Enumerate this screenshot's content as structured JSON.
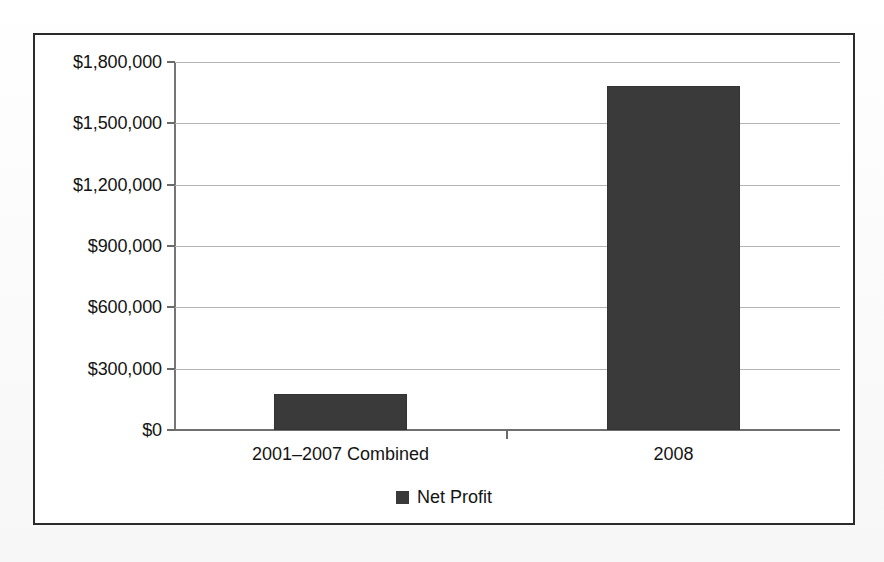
{
  "chart_data": {
    "type": "bar",
    "title": "",
    "xlabel": "",
    "ylabel": "",
    "categories": [
      "2001–2007 Combined",
      "2008"
    ],
    "values": [
      176000,
      1683000
    ],
    "series": [
      {
        "name": "Net Profit",
        "color": "#3a3a3a",
        "values": [
          176000,
          1683000
        ]
      }
    ],
    "ylim": [
      0,
      1800000
    ],
    "ytick_values": [
      1800000,
      1500000,
      1200000,
      900000,
      600000,
      300000,
      0
    ],
    "ytick_labels": [
      "$1,800,000",
      "$1,500,000",
      "$1,200,000",
      "$900,000",
      "$600,000",
      "$300,000",
      "$0"
    ],
    "grid": true,
    "grid_axis": "y",
    "legend": {
      "position": "bottom",
      "entries": [
        {
          "label": "Net Profit",
          "color": "#3a3a3a"
        }
      ]
    },
    "colors": {
      "bar_fill": "#3a3a3a",
      "gridline": "#b4b4b4",
      "axis_line": "#6f6f6f",
      "frame_border": "#2b2b2b",
      "plot_background": "#ffffff",
      "text": "#141414"
    }
  }
}
